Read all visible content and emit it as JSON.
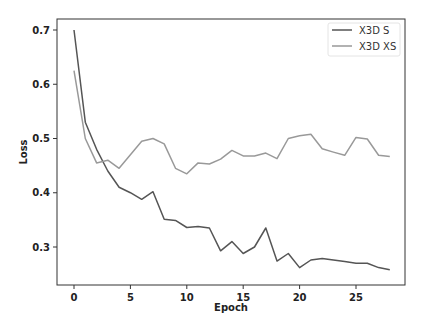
{
  "chart_data": {
    "type": "line",
    "title": "",
    "xlabel": "Epoch",
    "ylabel": "Loss",
    "xlim": [
      -1.5,
      29.4
    ],
    "ylim": [
      0.235,
      0.72
    ],
    "xticks": [
      0,
      5,
      10,
      15,
      20,
      25
    ],
    "yticks": [
      0.3,
      0.4,
      0.5,
      0.6,
      0.7
    ],
    "xtick_labels": [
      "0",
      "5",
      "10",
      "15",
      "20",
      "25"
    ],
    "ytick_labels": [
      "0.3",
      "0.4",
      "0.5",
      "0.6",
      "0.7"
    ],
    "grid": false,
    "legend_position": "upper right",
    "x": [
      0,
      1,
      2,
      3,
      4,
      5,
      6,
      7,
      8,
      9,
      10,
      11,
      12,
      13,
      14,
      15,
      16,
      17,
      18,
      19,
      20,
      21,
      22,
      23,
      24,
      25,
      26,
      27,
      28
    ],
    "series": [
      {
        "name": "X3D S",
        "color": "#555555",
        "values": [
          0.7,
          0.53,
          0.48,
          0.44,
          0.41,
          0.4,
          0.388,
          0.402,
          0.351,
          0.349,
          0.336,
          0.338,
          0.335,
          0.293,
          0.31,
          0.288,
          0.3,
          0.335,
          0.274,
          0.288,
          0.262,
          0.276,
          0.279,
          0.276,
          0.273,
          0.27,
          0.27,
          0.262,
          0.258
        ]
      },
      {
        "name": "X3D XS",
        "color": "#999999",
        "values": [
          0.625,
          0.5,
          0.455,
          0.46,
          0.445,
          0.47,
          0.495,
          0.5,
          0.49,
          0.445,
          0.435,
          0.455,
          0.453,
          0.462,
          0.478,
          0.468,
          0.468,
          0.473,
          0.463,
          0.5,
          0.505,
          0.508,
          0.481,
          0.475,
          0.469,
          0.502,
          0.499,
          0.469,
          0.467
        ]
      }
    ]
  },
  "legend": {
    "items": [
      {
        "label": "X3D S",
        "color": "#555555"
      },
      {
        "label": "X3D XS",
        "color": "#999999"
      }
    ]
  },
  "axes": {
    "xlabel": "Epoch",
    "ylabel": "Loss"
  }
}
